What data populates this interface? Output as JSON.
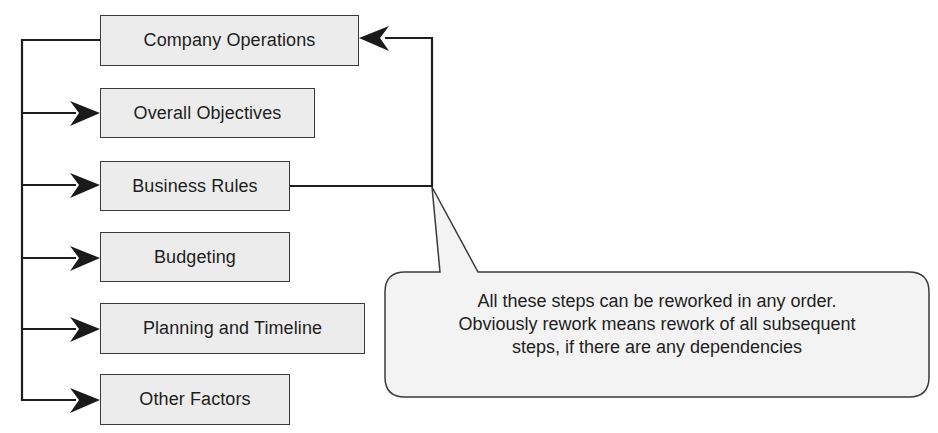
{
  "diagram": {
    "steps": [
      {
        "label": "Company Operations"
      },
      {
        "label": "Overall Objectives"
      },
      {
        "label": "Business Rules"
      },
      {
        "label": "Budgeting"
      },
      {
        "label": "Planning and Timeline"
      },
      {
        "label": "Other Factors"
      }
    ],
    "callout": {
      "lines": [
        "All these steps can be reworked in any order.",
        "Obviously rework means rework of all subsequent",
        "steps, if there are any dependencies"
      ]
    },
    "colors": {
      "box_fill": "#ececec",
      "stroke": "#1e1e1e",
      "callout_fill": "#f3f3f3"
    }
  }
}
